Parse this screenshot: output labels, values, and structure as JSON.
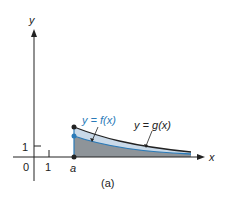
{
  "figure": {
    "caption": "(a)",
    "axes": {
      "x_label": "x",
      "y_label": "y",
      "origin_label": "0",
      "x_tick_label": "1",
      "y_tick_label": "1",
      "a_label": "a"
    },
    "curves": [
      {
        "name": "g",
        "label": "y = g(x)",
        "color": "#222222"
      },
      {
        "name": "f",
        "label": "y = f(x)",
        "color": "#2a7ab8"
      }
    ],
    "colors": {
      "region_between": "#c9d9e8",
      "region_under_f": "#8e9499",
      "accent": "#2a7ab8"
    }
  }
}
